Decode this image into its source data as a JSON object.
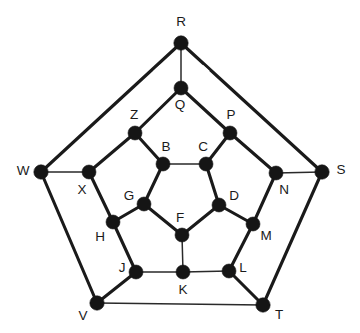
{
  "figure": {
    "background_color": "#ffffff",
    "node_color": "#151515",
    "edge_color": "#1a1a1a",
    "label_color": "#1a1a1a",
    "width": 360,
    "height": 333
  },
  "chart_data": {
    "type": "diagram",
    "title": "",
    "node_count": 20,
    "edge_count": 30,
    "nodes": [
      {
        "id": "R",
        "label": "R",
        "x": 181,
        "y": 43,
        "r": 7.2,
        "label_x": 181,
        "label_y": 22,
        "ring": "outer"
      },
      {
        "id": "S",
        "label": "S",
        "x": 322,
        "y": 172,
        "r": 7.2,
        "label_x": 341,
        "label_y": 170,
        "ring": "outer"
      },
      {
        "id": "T",
        "label": "T",
        "x": 263,
        "y": 305,
        "r": 7.2,
        "label_x": 279,
        "label_y": 315,
        "ring": "outer"
      },
      {
        "id": "V",
        "label": "V",
        "x": 97,
        "y": 303,
        "r": 7.2,
        "label_x": 83,
        "label_y": 316,
        "ring": "outer"
      },
      {
        "id": "W",
        "label": "W",
        "x": 41,
        "y": 172,
        "r": 7.2,
        "label_x": 23,
        "label_y": 171,
        "ring": "outer"
      },
      {
        "id": "Q",
        "label": "Q",
        "x": 181,
        "y": 88,
        "r": 7.0,
        "label_x": 180,
        "label_y": 105,
        "ring": "middle"
      },
      {
        "id": "P",
        "label": "P",
        "x": 230,
        "y": 133,
        "r": 7.0,
        "label_x": 231,
        "label_y": 115,
        "ring": "middle"
      },
      {
        "id": "N",
        "label": "N",
        "x": 276,
        "y": 173,
        "r": 7.0,
        "label_x": 284,
        "label_y": 190,
        "ring": "middle"
      },
      {
        "id": "M",
        "label": "M",
        "x": 253,
        "y": 224,
        "r": 7.0,
        "label_x": 266,
        "label_y": 236,
        "ring": "middle"
      },
      {
        "id": "L",
        "label": "L",
        "x": 229,
        "y": 271,
        "r": 7.0,
        "label_x": 243,
        "label_y": 268,
        "ring": "middle"
      },
      {
        "id": "K",
        "label": "K",
        "x": 183,
        "y": 272,
        "r": 7.0,
        "label_x": 183,
        "label_y": 290,
        "ring": "middle"
      },
      {
        "id": "J",
        "label": "J",
        "x": 136,
        "y": 272,
        "r": 7.0,
        "label_x": 122,
        "label_y": 268,
        "ring": "middle"
      },
      {
        "id": "H",
        "label": "H",
        "x": 113,
        "y": 222,
        "r": 7.0,
        "label_x": 100,
        "label_y": 237,
        "ring": "middle"
      },
      {
        "id": "X",
        "label": "X",
        "x": 89,
        "y": 172,
        "r": 7.0,
        "label_x": 82,
        "label_y": 190,
        "ring": "middle"
      },
      {
        "id": "Z",
        "label": "Z",
        "x": 135,
        "y": 133,
        "r": 7.0,
        "label_x": 134,
        "label_y": 115,
        "ring": "middle"
      },
      {
        "id": "B",
        "label": "B",
        "x": 163,
        "y": 164,
        "r": 7.0,
        "label_x": 166,
        "label_y": 147,
        "ring": "inner"
      },
      {
        "id": "C",
        "label": "C",
        "x": 206,
        "y": 164,
        "r": 7.0,
        "label_x": 203,
        "label_y": 147,
        "ring": "inner"
      },
      {
        "id": "D",
        "label": "D",
        "x": 219,
        "y": 205,
        "r": 7.0,
        "label_x": 234,
        "label_y": 196,
        "ring": "inner"
      },
      {
        "id": "F",
        "label": "F",
        "x": 182,
        "y": 235,
        "r": 7.0,
        "label_x": 180,
        "label_y": 218,
        "ring": "inner"
      },
      {
        "id": "G",
        "label": "G",
        "x": 144,
        "y": 204,
        "r": 7.0,
        "label_x": 129,
        "label_y": 196,
        "ring": "inner"
      }
    ],
    "edges": [
      {
        "from": "R",
        "to": "W",
        "weight": "thick"
      },
      {
        "from": "R",
        "to": "S",
        "weight": "thick"
      },
      {
        "from": "W",
        "to": "V",
        "weight": "thick"
      },
      {
        "from": "S",
        "to": "T",
        "weight": "thick"
      },
      {
        "from": "V",
        "to": "T",
        "weight": "thin"
      },
      {
        "from": "R",
        "to": "Q",
        "weight": "thin"
      },
      {
        "from": "W",
        "to": "X",
        "weight": "thin"
      },
      {
        "from": "S",
        "to": "N",
        "weight": "thin"
      },
      {
        "from": "V",
        "to": "J",
        "weight": "thick"
      },
      {
        "from": "T",
        "to": "L",
        "weight": "thick"
      },
      {
        "from": "Q",
        "to": "Z",
        "weight": "thick"
      },
      {
        "from": "Q",
        "to": "P",
        "weight": "thick"
      },
      {
        "from": "P",
        "to": "N",
        "weight": "thick"
      },
      {
        "from": "N",
        "to": "M",
        "weight": "thick"
      },
      {
        "from": "M",
        "to": "L",
        "weight": "thick"
      },
      {
        "from": "L",
        "to": "K",
        "weight": "thin"
      },
      {
        "from": "K",
        "to": "J",
        "weight": "thin"
      },
      {
        "from": "J",
        "to": "H",
        "weight": "thick"
      },
      {
        "from": "H",
        "to": "X",
        "weight": "thick"
      },
      {
        "from": "X",
        "to": "Z",
        "weight": "thick"
      },
      {
        "from": "Z",
        "to": "B",
        "weight": "thick"
      },
      {
        "from": "P",
        "to": "C",
        "weight": "thick"
      },
      {
        "from": "M",
        "to": "D",
        "weight": "thick"
      },
      {
        "from": "K",
        "to": "F",
        "weight": "thin"
      },
      {
        "from": "H",
        "to": "G",
        "weight": "thick"
      },
      {
        "from": "B",
        "to": "C",
        "weight": "thin"
      },
      {
        "from": "C",
        "to": "D",
        "weight": "thick"
      },
      {
        "from": "D",
        "to": "F",
        "weight": "thick"
      },
      {
        "from": "F",
        "to": "G",
        "weight": "thick"
      },
      {
        "from": "G",
        "to": "B",
        "weight": "thick"
      }
    ],
    "edge_gaps": [
      {
        "x": 158,
        "y": 69,
        "angle": -42
      },
      {
        "x": 205,
        "y": 69,
        "angle": 42
      }
    ],
    "legend": [],
    "xlabel": "",
    "ylabel": ""
  }
}
